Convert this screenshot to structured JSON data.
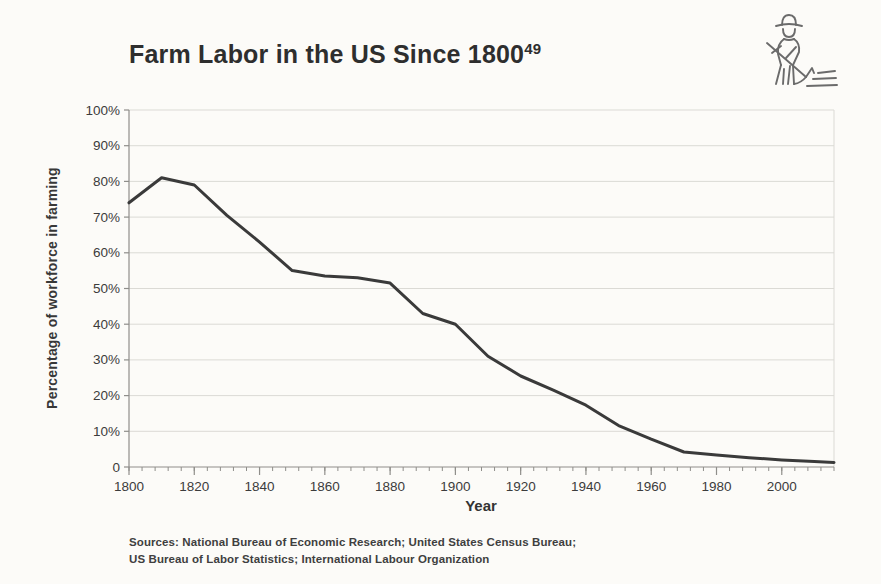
{
  "header": {
    "title": "Farm Labor in the US Since 1800",
    "footnote_ref": "49"
  },
  "icon": {
    "name": "farmer-raking-icon"
  },
  "chart_data": {
    "type": "line",
    "title": "Farm Labor in the US Since 1800",
    "xlabel": "Year",
    "ylabel": "Percentage of workforce in farming",
    "x": [
      1800,
      1810,
      1820,
      1830,
      1840,
      1850,
      1860,
      1870,
      1880,
      1890,
      1900,
      1910,
      1920,
      1930,
      1940,
      1950,
      1960,
      1970,
      1980,
      1990,
      2000,
      2010,
      2016
    ],
    "values": [
      74,
      81,
      79,
      70.5,
      63,
      55,
      53.5,
      53,
      51.5,
      43,
      40,
      31,
      25.5,
      21.5,
      17.3,
      11.6,
      7.8,
      4.2,
      3.4,
      2.6,
      2.0,
      1.5,
      1.3
    ],
    "ylim": [
      0,
      100
    ],
    "xlim": [
      1800,
      2016
    ],
    "ytick_values": [
      100,
      90,
      80,
      70,
      60,
      50,
      40,
      30,
      20,
      10,
      0
    ],
    "ytick_labels": [
      "100%",
      "90%",
      "80%",
      "70%",
      "60%",
      "50%",
      "40%",
      "30%",
      "20%",
      "10%",
      "0"
    ],
    "xtick_values": [
      1800,
      1820,
      1840,
      1860,
      1880,
      1900,
      1920,
      1940,
      1960,
      1980,
      2000
    ],
    "minor_xtick_step": 4,
    "grid": "horizontal",
    "legend": "none",
    "line_color": "#3a3a3a",
    "grid_color": "#dbdad5",
    "axis_color": "#8f8e8a",
    "text_color": "#3c3c3c"
  },
  "footer": {
    "sources_line1": "Sources: National Bureau of Economic Research; United States Census Bureau;",
    "sources_line2": "US Bureau of Labor Statistics; International Labour Organization"
  }
}
